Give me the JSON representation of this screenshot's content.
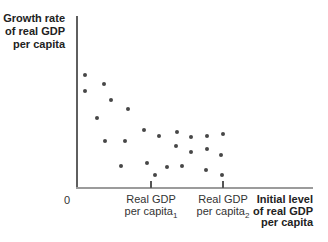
{
  "figure": {
    "y_axis_title_lines": [
      "Growth rate",
      "of real GDP",
      "per capita"
    ],
    "x_axis_title_lines": [
      "Initial level",
      "of real GDP",
      "per capita"
    ],
    "origin_label": "0",
    "colors": {
      "dot": "#474747",
      "y_axis": "#5f5f5f",
      "x_axis": "#9b9b9b",
      "tick": "#555555",
      "title_text": "#222222",
      "label_text": "#333333",
      "background": "#ffffff"
    }
  },
  "chart_data": {
    "type": "scatter",
    "title": "",
    "ylabel": "Growth rate of real GDP per capita",
    "xlabel": "Initial level of real GDP per capita",
    "axis_values_shown": false,
    "legend": "none",
    "grid": false,
    "origin_label": "0",
    "x_ticks": [
      {
        "line1": "Real GDP",
        "line2": "per capita",
        "sub": "1",
        "x_px": 151
      },
      {
        "line1": "Real GDP",
        "line2": "per capita",
        "sub": "2",
        "x_px": 223
      }
    ],
    "axes_geometry_px": {
      "origin": [
        76,
        188
      ],
      "x_axis_end": 313,
      "y_axis_top": 16
    },
    "points_px": [
      [
        85,
        75
      ],
      [
        104,
        84
      ],
      [
        85,
        91
      ],
      [
        111,
        100
      ],
      [
        128,
        109
      ],
      [
        97,
        118
      ],
      [
        144,
        130
      ],
      [
        159,
        136
      ],
      [
        105,
        141
      ],
      [
        125,
        141
      ],
      [
        147,
        163
      ],
      [
        121,
        166
      ],
      [
        155,
        175
      ],
      [
        167,
        167
      ],
      [
        177,
        132
      ],
      [
        191,
        137
      ],
      [
        207,
        136
      ],
      [
        223,
        134
      ],
      [
        176,
        146
      ],
      [
        191,
        152
      ],
      [
        207,
        149
      ],
      [
        221,
        155
      ],
      [
        182,
        166
      ],
      [
        206,
        170
      ],
      [
        222,
        175
      ]
    ]
  }
}
